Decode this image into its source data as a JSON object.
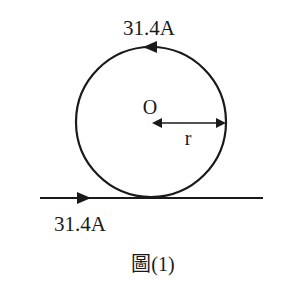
{
  "diagram": {
    "type": "physics-circuit-figure",
    "loop_current_label": "31.4A",
    "wire_current_label": "31.4A",
    "center_label": "O",
    "radius_label": "r",
    "caption": "圖(1)",
    "stroke_color": "#1a1a1a",
    "background": "#ffffff",
    "loop_current_direction": "counterclockwise",
    "wire_current_direction": "left-to-right"
  }
}
